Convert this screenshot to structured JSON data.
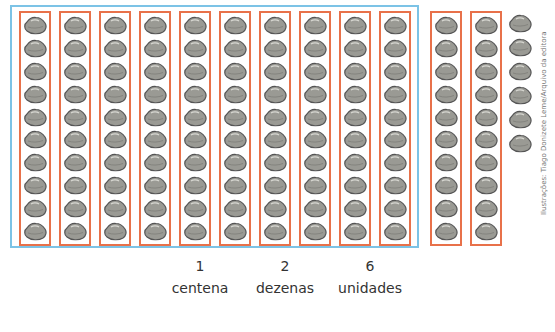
{
  "diagram": {
    "colors": {
      "hundred_frame": "#7cc3e6",
      "ten_group_border": "#e8714a",
      "stone_fill": "#9a9a94",
      "stone_outline": "#555555"
    },
    "hundred_group": {
      "columns": 10,
      "stones_per_column": 10
    },
    "extra_ten_groups": {
      "columns": 2,
      "stones_per_column": 10
    },
    "loose_units": 6
  },
  "labels": {
    "centena": {
      "value": "1",
      "text": "centena"
    },
    "dezenas": {
      "value": "2",
      "text": "dezenas"
    },
    "unidades": {
      "value": "6",
      "text": "unidades"
    }
  },
  "credit": "Ilustrações: Tiago Donizete Leme/Arquivo da editora"
}
